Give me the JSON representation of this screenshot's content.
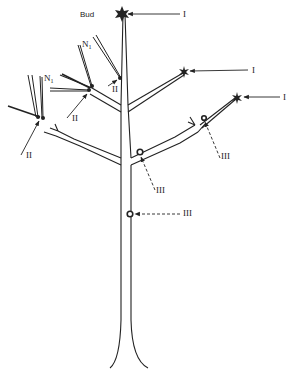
{
  "diagram": {
    "labels": {
      "bud": "Bud",
      "type_i": "I",
      "type_ii": "II",
      "type_iii": "III",
      "n1_left": "N",
      "n1_left_sub": "1",
      "n1_mid": "N",
      "n1_mid_sub": "1"
    },
    "colors": {
      "stroke": "#222222",
      "background": "#ffffff"
    }
  }
}
